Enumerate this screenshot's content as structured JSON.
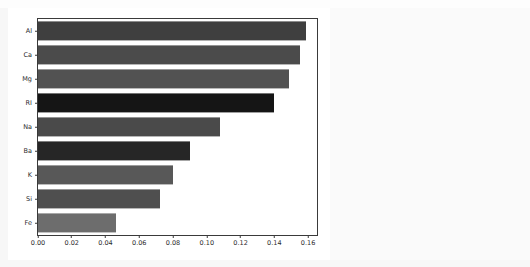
{
  "page": {
    "background_color": "#fbfbfb",
    "figure_background_color": "#ffffff",
    "top_ghost_text": ""
  },
  "chart_data": {
    "type": "bar",
    "orientation": "horizontal",
    "title": "",
    "subtitle": "",
    "xlabel": "",
    "ylabel": "",
    "categories": [
      "Al",
      "Ca",
      "Mg",
      "RI",
      "Na",
      "Ba",
      "K",
      "Si",
      "Fe"
    ],
    "values": [
      0.159,
      0.155,
      0.149,
      0.14,
      0.108,
      0.09,
      0.08,
      0.072,
      0.046
    ],
    "bar_colors": [
      "#3f3f3f",
      "#4b4b4b",
      "#525252",
      "#151515",
      "#4a4a4a",
      "#262626",
      "#585858",
      "#4f4f4f",
      "#6d6d6d"
    ],
    "xlim": [
      0.0,
      0.1653
    ],
    "ylim_categories_top_to_bottom": true,
    "xticks": [
      0.0,
      0.02,
      0.04,
      0.06,
      0.08,
      0.1,
      0.12,
      0.14,
      0.16
    ],
    "xticklabels": [
      "0.00",
      "0.02",
      "0.04",
      "0.06",
      "0.08",
      "0.10",
      "0.12",
      "0.14",
      "0.16"
    ],
    "yticklabels": [
      "Al",
      "Ca",
      "Mg",
      "RI",
      "Na",
      "Ba",
      "K",
      "Si",
      "Fe"
    ],
    "grid": false,
    "legend": null,
    "legend_position": "none",
    "axis_color": "#3a3a3a",
    "tick_label_color": "#2b2b2b"
  }
}
